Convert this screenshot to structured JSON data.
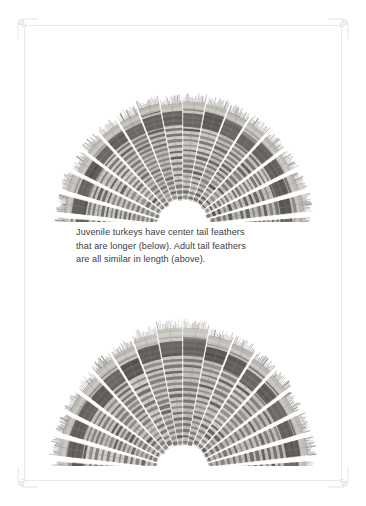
{
  "page": {
    "background_color": "#ffffff",
    "frame_color": "#e9e9ea",
    "ornament_color": "#e4e4e6"
  },
  "caption": {
    "full_text": "Juvenile turkeys have center tail feathers that are longer (below). Adult tail feathers are all similar in length (above).",
    "lines": [
      "Juvenile turkeys have center tail feathers",
      "that are longer (below). Adult tail feathers",
      "are all similar in length (above)."
    ],
    "text_color": "#3b3b40"
  },
  "figures": [
    {
      "id": "adult-tail-fan",
      "label": "Adult turkey tail fan",
      "age_class": "Adult",
      "position": "above",
      "description": "Fanned turkey tail showing barred feathers all similar in length",
      "center_feathers_longer": false,
      "feather_count": 18,
      "tone_dark": "#6c6864",
      "tone_mid": "#9c9892",
      "tone_light": "#cfcac4"
    },
    {
      "id": "juvenile-tail-fan",
      "label": "Juvenile turkey tail fan",
      "age_class": "Juvenile",
      "position": "below",
      "description": "Fanned turkey tail showing longer center tail feathers",
      "center_feathers_longer": true,
      "feather_count": 18,
      "tone_dark": "#6c6864",
      "tone_mid": "#9c9892",
      "tone_light": "#cfcac4"
    }
  ]
}
